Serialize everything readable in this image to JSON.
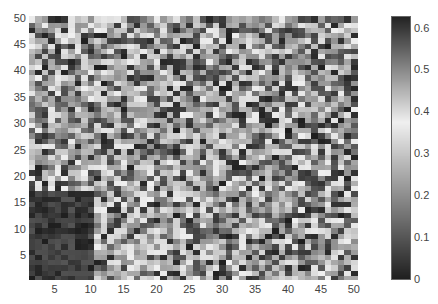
{
  "chart_data": {
    "type": "heatmap",
    "title": "",
    "xlabel": "",
    "ylabel": "",
    "rows": 50,
    "cols": 50,
    "xlim": [
      0.5,
      50.5
    ],
    "ylim": [
      0.5,
      50.5
    ],
    "x_ticks": [
      "5",
      "10",
      "15",
      "20",
      "25",
      "30",
      "35",
      "40",
      "45",
      "50"
    ],
    "y_ticks": [
      "5",
      "10",
      "15",
      "20",
      "25",
      "30",
      "35",
      "40",
      "45",
      "50"
    ],
    "colormap": "gray-reversed-custom",
    "clim": [
      0,
      0.63
    ],
    "colorbar_ticks": [
      "0",
      "0.1",
      "0.2",
      "0.3",
      "0.4",
      "0.5",
      "0.6"
    ],
    "seed": 7
  }
}
